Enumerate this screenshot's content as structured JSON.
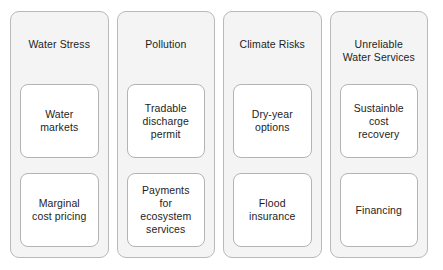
{
  "diagram": {
    "type": "four-column-grouping",
    "colors": {
      "page_background": "#ffffff",
      "panel_fill": "#f4f4f4",
      "panel_border": "#b9b9b9",
      "card_fill": "#ffffff",
      "card_border": "#b4b4b4",
      "text": "#1d1d1d"
    },
    "columns": [
      {
        "header": "Water Stress",
        "cards": [
          {
            "label": "Water\nmarkets"
          },
          {
            "label": "Marginal\ncost pricing"
          }
        ]
      },
      {
        "header": "Pollution",
        "cards": [
          {
            "label": "Tradable\ndischarge\npermit"
          },
          {
            "label": "Payments\nfor\necosystem\nservices"
          }
        ]
      },
      {
        "header": "Climate Risks",
        "cards": [
          {
            "label": "Dry-year\noptions"
          },
          {
            "label": "Flood\ninsurance"
          }
        ]
      },
      {
        "header": "Unreliable\nWater Services",
        "cards": [
          {
            "label": "Sustainble\ncost\nrecovery"
          },
          {
            "label": "Financing"
          }
        ]
      }
    ]
  }
}
